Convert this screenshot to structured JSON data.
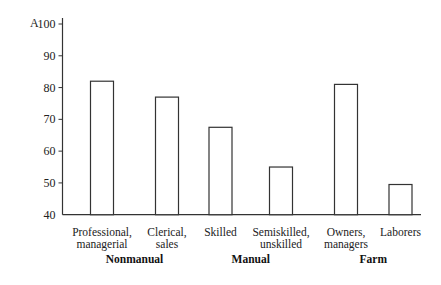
{
  "chart_data": {
    "type": "bar",
    "panel_label": "A",
    "title": "",
    "xlabel": "",
    "ylabel": "",
    "ylim": [
      40,
      100
    ],
    "yticks": [
      40,
      50,
      60,
      70,
      80,
      90,
      100
    ],
    "grid": false,
    "legend": null,
    "categories": [
      {
        "line1": "Professional,",
        "line2": "managerial"
      },
      {
        "line1": "Clerical,",
        "line2": "sales"
      },
      {
        "line1": "Skilled",
        "line2": ""
      },
      {
        "line1": "Semiskilled,",
        "line2": "unskilled"
      },
      {
        "line1": "Owners,",
        "line2": "managers"
      },
      {
        "line1": "Laborers",
        "line2": ""
      }
    ],
    "values": [
      82,
      77,
      67.5,
      55,
      81,
      49.5
    ],
    "groups": [
      {
        "label": "Nonmanual",
        "categories": [
          0,
          1
        ]
      },
      {
        "label": "Manual",
        "categories": [
          2,
          3
        ]
      },
      {
        "label": "Farm",
        "categories": [
          4,
          5
        ]
      }
    ],
    "colors": {
      "bar_fill": "#ffffff",
      "bar_stroke": "#333333",
      "axis": "#333333"
    }
  }
}
